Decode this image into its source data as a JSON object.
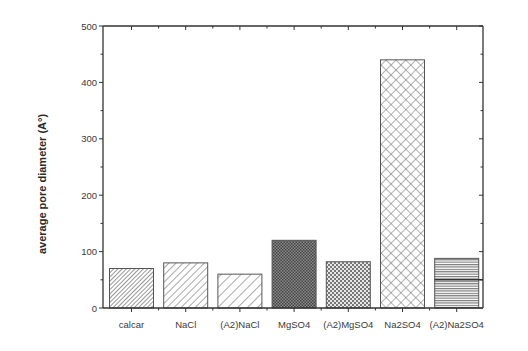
{
  "chart_data": {
    "type": "bar",
    "title": "",
    "xlabel": "",
    "ylabel": "average pore diameter (A°)",
    "ylim": [
      0,
      500
    ],
    "yticks": [
      0,
      100,
      200,
      300,
      400,
      500
    ],
    "grid": false,
    "legend": null,
    "categories": [
      "calcar",
      "NaCl",
      "(A2)NaCl",
      "MgSO4",
      "(A2)MgSO4",
      "Na2SO4",
      "(A2)Na2SO4"
    ],
    "values": [
      70,
      80,
      60,
      120,
      82,
      440,
      88
    ],
    "patterns": [
      "dense-diagonal-back",
      "diagonal-back",
      "wide-diagonal-back",
      "dense-crosshatch",
      "crosshatch",
      "wide-diagonal-crosshatch",
      "horizontal-lines"
    ],
    "annotations": [
      {
        "type": "hline-segment",
        "y": 50,
        "x_from_category": "(A2)Na2SO4",
        "note": "dark horizontal line across last bar at ~50"
      }
    ]
  },
  "colors": {
    "axis": "#333333",
    "bar_edge": "#555555",
    "pattern": "#555555",
    "background": "#ffffff"
  }
}
